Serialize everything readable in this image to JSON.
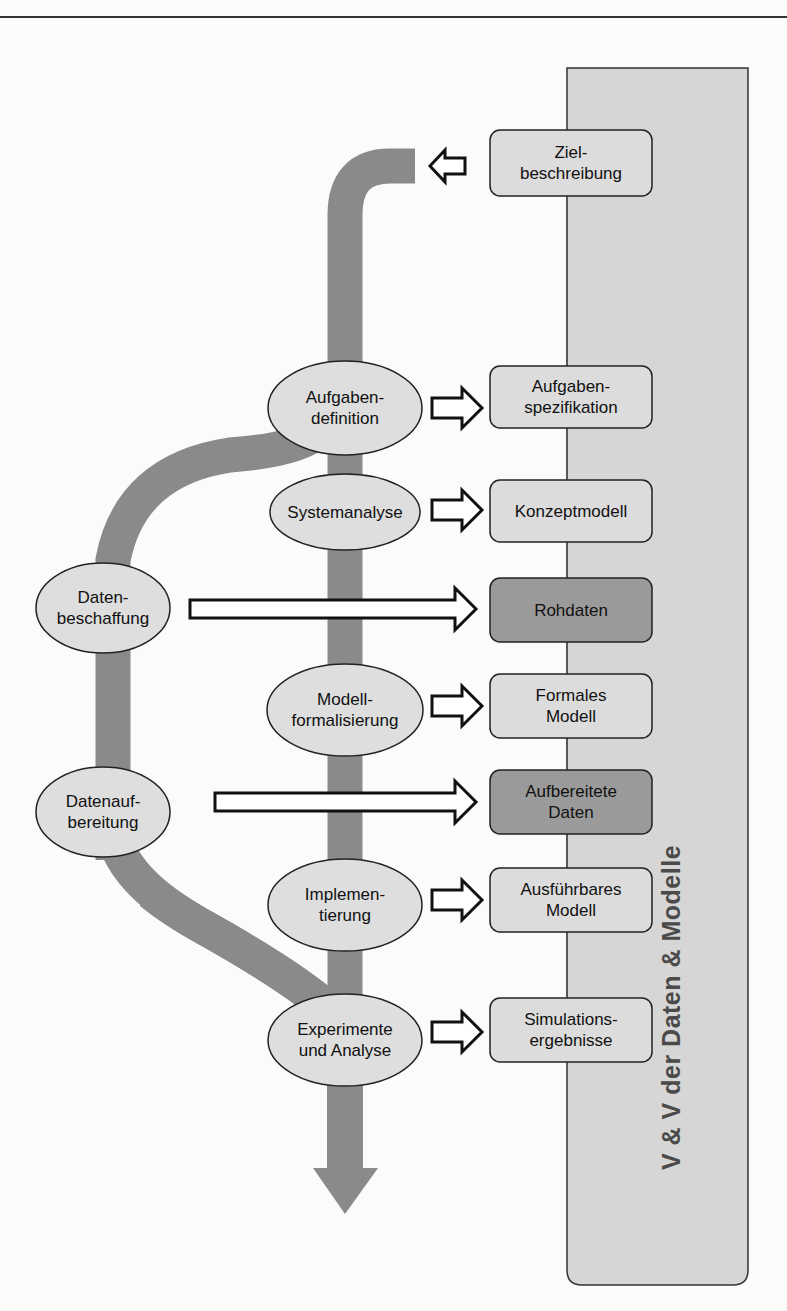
{
  "figure": {
    "panel_title": "V & V der Daten & Modelle",
    "colors": {
      "band": "#8a8a8a",
      "panel": "#d6d6d6",
      "box_light": "#dcdcdc",
      "box_dark": "#9a9a9a",
      "ellipse": "#dedede",
      "outline": "#222222"
    },
    "process_steps": [
      {
        "id": "aufgabendefinition",
        "label": "Aufgaben-\ndefinition"
      },
      {
        "id": "systemanalyse",
        "label": "Systemanalyse"
      },
      {
        "id": "datenbeschaffung",
        "label": "Daten-\nbeschaffung"
      },
      {
        "id": "modellformalisierung",
        "label": "Modell-\nformalisierung"
      },
      {
        "id": "datenaufbereitung",
        "label": "Datenauf-\nbereitung"
      },
      {
        "id": "implementierung",
        "label": "Implemen-\ntierung"
      },
      {
        "id": "experimente",
        "label": "Experimente\nund Analyse"
      }
    ],
    "artifacts": [
      {
        "id": "zielbeschreibung",
        "label": "Ziel-\nbeschreibung",
        "shade": "light"
      },
      {
        "id": "aufgabenspezifikation",
        "label": "Aufgaben-\nspezifikation",
        "shade": "light"
      },
      {
        "id": "konzeptmodell",
        "label": "Konzeptmodell",
        "shade": "light"
      },
      {
        "id": "rohdaten",
        "label": "Rohdaten",
        "shade": "dark"
      },
      {
        "id": "formales-modell",
        "label": "Formales\nModell",
        "shade": "light"
      },
      {
        "id": "aufbereitete-daten",
        "label": "Aufbereitete\nDaten",
        "shade": "dark"
      },
      {
        "id": "ausfuehrbares-modell",
        "label": "Ausführbares\nModell",
        "shade": "light"
      },
      {
        "id": "simulationsergebnisse",
        "label": "Simulations-\nergebnisse",
        "shade": "light"
      }
    ]
  }
}
